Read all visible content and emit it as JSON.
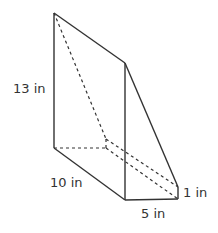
{
  "diagram": {
    "type": "triangular prism",
    "labels": {
      "height": "13 in",
      "depth": "10 in",
      "width": "5 in",
      "short_edge": "1 in"
    },
    "colors": {
      "line": "#333333",
      "background": "#ffffff"
    }
  }
}
